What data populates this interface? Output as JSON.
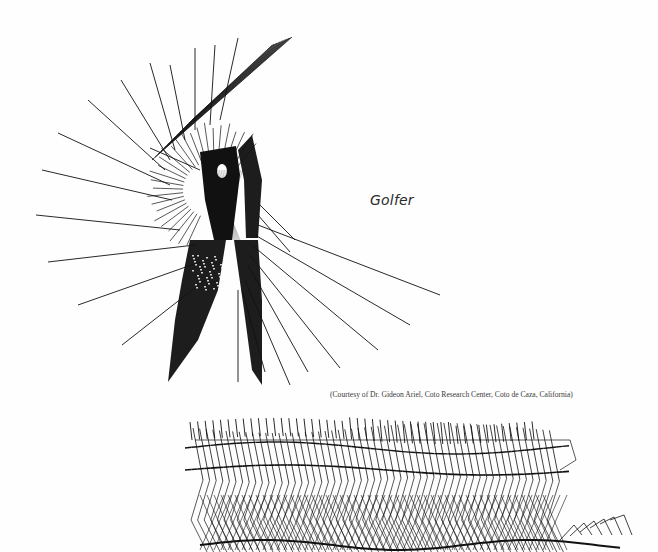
{
  "page": {
    "background": "#fefefe",
    "ink_color": "#111111"
  },
  "golfer_figure": {
    "caption": "Golfer",
    "credit": "(Courtesy of Dr. Gideon Ariel, Coto Research Center, Coto de Caza, California)"
  },
  "runner_figure": {
    "caption": ""
  }
}
